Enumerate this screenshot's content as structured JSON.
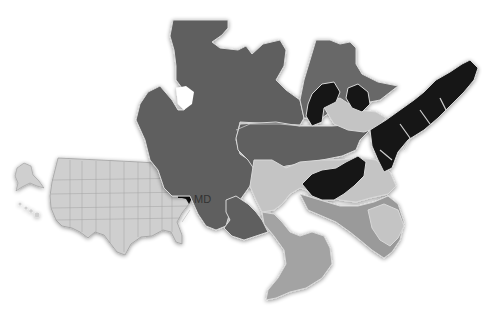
{
  "inset": {
    "label": "MD",
    "highlighted_state": "Maryland",
    "colors": {
      "states": "#cfcfcf",
      "borders": "#9a9a9a",
      "highlight": "#111111"
    }
  },
  "main_map": {
    "regions": [
      {
        "name": "region-western",
        "shade": "#5e5e5e"
      },
      {
        "name": "region-north-central",
        "shade": "#686868"
      },
      {
        "name": "region-central",
        "shade": "#606060"
      },
      {
        "name": "region-light",
        "shade": "#c4c4c4"
      },
      {
        "name": "region-black",
        "shade": "#151515"
      },
      {
        "name": "region-medium",
        "shade": "#9a9a9a"
      },
      {
        "name": "region-south",
        "shade": "#a3a3a3"
      }
    ]
  }
}
